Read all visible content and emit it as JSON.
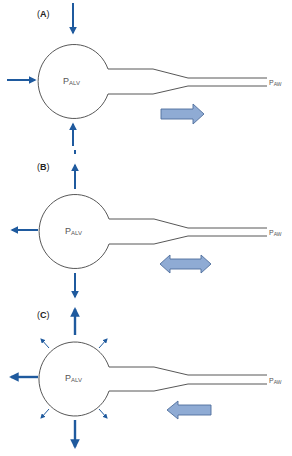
{
  "figure": {
    "panels": [
      {
        "id": "A",
        "label_open": "(",
        "label_letter": "A",
        "label_close": ")",
        "alveolar_pressure": {
          "main": "P",
          "sub": "ALV"
        },
        "airway_pressure": {
          "main": "P",
          "sub": "AW"
        },
        "force_arrows": [
          "down-from-top (inward)",
          "right-from-left (inward)",
          "up-from-bottom (inward)"
        ],
        "flow_arrow": "right"
      },
      {
        "id": "B",
        "label_open": "(",
        "label_letter": "B",
        "label_close": ")",
        "alveolar_pressure": {
          "main": "P",
          "sub": "ALV"
        },
        "airway_pressure": {
          "main": "P",
          "sub": "AW"
        },
        "force_arrows": [
          "up (outward)",
          "left (outward)",
          "down (outward)"
        ],
        "flow_arrow": "bidirectional"
      },
      {
        "id": "C",
        "label_open": "(",
        "label_letter": "C",
        "label_close": ")",
        "alveolar_pressure": {
          "main": "P",
          "sub": "ALV"
        },
        "airway_pressure": {
          "main": "P",
          "sub": "AW"
        },
        "force_arrows": [
          "up (outward)",
          "left (outward)",
          "down (outward)",
          "4 small diagonal outward"
        ],
        "flow_arrow": "left"
      }
    ],
    "colors": {
      "force_arrow": "#1f5a9e",
      "flow_arrow_fill": "#8fabd4",
      "flow_arrow_stroke": "#4f6e9c",
      "outline": "#444444",
      "text": "#555555"
    }
  }
}
